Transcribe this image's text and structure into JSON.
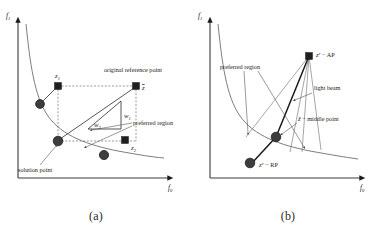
{
  "figure": {
    "panels": [
      {
        "caption": "(a)",
        "axes": {
          "y": "f",
          "y_sub": "1",
          "x": "f",
          "x_sub": "0"
        },
        "markers": [
          {
            "id": "z1",
            "type": "square",
            "label": "z",
            "label_sub": "1"
          },
          {
            "id": "zbar",
            "type": "square",
            "label": "z",
            "label_bar": true
          },
          {
            "id": "z2",
            "type": "square",
            "label": "z",
            "label_sub": "2"
          },
          {
            "id": "front-point-upper",
            "type": "circle",
            "label": ""
          },
          {
            "id": "solution-point",
            "type": "circle",
            "label": ""
          },
          {
            "id": "front-point-lower",
            "type": "circle",
            "label": ""
          }
        ],
        "annotations": [
          {
            "id": "original-reference-point",
            "text": "original reference point"
          },
          {
            "id": "preferred-region",
            "text": "preferred region"
          },
          {
            "id": "solution-point",
            "text": "solution point"
          },
          {
            "id": "weight-1",
            "text": "w",
            "sub": "1"
          },
          {
            "id": "weight-2",
            "text": "w",
            "sub": "2"
          }
        ]
      },
      {
        "caption": "(b)",
        "axes": {
          "y": "f",
          "y_sub": "1",
          "x": "f",
          "x_sub": "0"
        },
        "markers": [
          {
            "id": "aspiration-point",
            "type": "square",
            "label": "z",
            "label_sup": "r",
            "label_suffix": " − AP"
          },
          {
            "id": "middle-point",
            "type": "circle",
            "label": "ẑ",
            "label_suffix": " − middle point"
          },
          {
            "id": "reservation-point",
            "type": "circle",
            "label": "z",
            "label_sup": "v",
            "label_suffix": " − RP"
          }
        ],
        "annotations": [
          {
            "id": "preferred-region",
            "text": "preferred region"
          },
          {
            "id": "light-beam",
            "text": "light beam"
          }
        ]
      }
    ]
  },
  "colors": {
    "ink": "#1a1a1a",
    "front": "#6e6e6e",
    "axis": "#3a3a3a",
    "marker_fill": "#1f1f1f",
    "circle_fill": "#3d3d3d"
  }
}
